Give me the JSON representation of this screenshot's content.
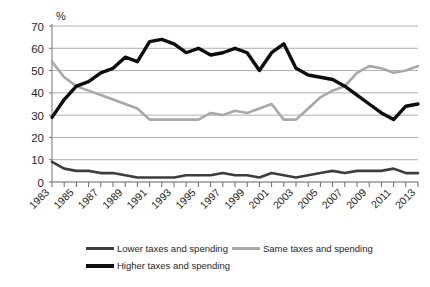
{
  "chart_data": {
    "type": "line",
    "title": "",
    "subtitle": "",
    "xlabel": "",
    "ylabel": "%",
    "unit_label": "%",
    "ylim": [
      0,
      70
    ],
    "yticks": [
      0,
      10,
      20,
      30,
      40,
      50,
      60,
      70
    ],
    "grid": true,
    "grid_axis": "y",
    "legend_position": "bottom",
    "x": [
      1983,
      1984,
      1985,
      1986,
      1987,
      1988,
      1989,
      1990,
      1991,
      1992,
      1993,
      1994,
      1995,
      1996,
      1997,
      1998,
      1999,
      2000,
      2001,
      2002,
      2003,
      2004,
      2005,
      2006,
      2007,
      2008,
      2009,
      2010,
      2011,
      2012,
      2013
    ],
    "xtick_labels": [
      "1983",
      "1985",
      "1987",
      "1989",
      "1991",
      "1993",
      "1995",
      "1997",
      "1999",
      "2001",
      "2003",
      "2005",
      "2007",
      "2009",
      "2011",
      "2013"
    ],
    "xticks": [
      1983,
      1985,
      1987,
      1989,
      1991,
      1993,
      1995,
      1997,
      1999,
      2001,
      2003,
      2005,
      2007,
      2009,
      2011,
      2013
    ],
    "series": [
      {
        "name": "Lower taxes and spending",
        "color": "#3d3d3d",
        "width": 2.6,
        "values": [
          9,
          6,
          5,
          5,
          4,
          4,
          3,
          2,
          2,
          2,
          2,
          3,
          3,
          3,
          4,
          3,
          3,
          2,
          4,
          3,
          2,
          3,
          4,
          5,
          4,
          5,
          5,
          5,
          6,
          4,
          4
        ]
      },
      {
        "name": "Same taxes and spending",
        "color": "#a8a8a8",
        "width": 2.6,
        "values": [
          54,
          47,
          43,
          41,
          39,
          37,
          35,
          33,
          28,
          28,
          28,
          28,
          28,
          31,
          30,
          32,
          31,
          33,
          35,
          28,
          28,
          33,
          38,
          41,
          43,
          49,
          52,
          51,
          49,
          50,
          52
        ]
      },
      {
        "name": "Higher taxes and spending",
        "color": "#0d0d0d",
        "width": 3.4,
        "values": [
          29,
          37,
          43,
          45,
          49,
          51,
          56,
          54,
          63,
          64,
          62,
          58,
          60,
          57,
          58,
          60,
          58,
          50,
          58,
          62,
          51,
          48,
          47,
          46,
          43,
          39,
          35,
          31,
          28,
          34,
          35
        ]
      }
    ],
    "legend": [
      {
        "label": "Lower taxes and spending",
        "style": "lower"
      },
      {
        "label": "Same taxes and spending",
        "style": "same"
      },
      {
        "label": "Higher taxes and spending",
        "style": "higher"
      }
    ]
  }
}
